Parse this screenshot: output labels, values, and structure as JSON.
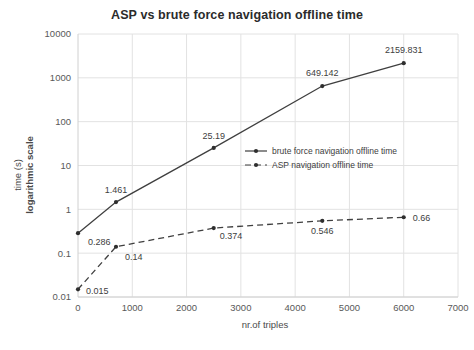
{
  "chart_data": {
    "type": "line",
    "title": "ASP vs brute force navigation offline time",
    "xlabel": "nr.of triples",
    "ylabel": "time (s)\nlogarithmic scale",
    "ylabel_line1": "time (s)",
    "ylabel_line2": "logarithmic scale",
    "yscale": "log",
    "xlim": [
      0,
      7000
    ],
    "ylim": [
      0.01,
      10000
    ],
    "grid": true,
    "legend_position": "center-right",
    "xticks": [
      "0",
      "1000",
      "2000",
      "3000",
      "4000",
      "5000",
      "6000",
      "7000"
    ],
    "xtick_values": [
      0,
      1000,
      2000,
      3000,
      4000,
      5000,
      6000,
      7000
    ],
    "yticks": [
      "0.01",
      "0.1",
      "1",
      "10",
      "100",
      "1000",
      "10000"
    ],
    "ytick_values": [
      0.01,
      0.1,
      1,
      10,
      100,
      1000,
      10000
    ],
    "x": [
      0,
      700,
      2500,
      4500,
      6000
    ],
    "series": [
      {
        "name": "brute force navigation offline time",
        "style": "solid",
        "values": [
          0.286,
          1.461,
          25.19,
          649.142,
          2159.831
        ],
        "labels": [
          "0.286",
          "1.461",
          "25.19",
          "649.142",
          "2159.831"
        ]
      },
      {
        "name": "ASP navigation offline time",
        "style": "dashed",
        "values": [
          0.015,
          0.14,
          0.374,
          0.546,
          0.66
        ],
        "labels": [
          "0.015",
          "0.14",
          "0.374",
          "0.546",
          "0.66"
        ]
      }
    ],
    "colors": {
      "series": "#3f3f3f",
      "grid": "#e2e2e2",
      "text": "#595959",
      "background": "#ffffff"
    }
  }
}
